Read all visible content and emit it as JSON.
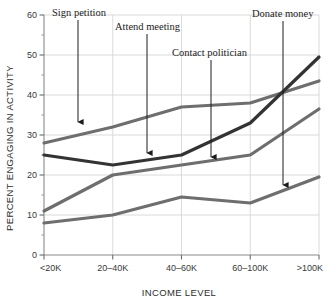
{
  "chart_data": {
    "type": "line",
    "title": "",
    "xlabel": "INCOME LEVEL",
    "ylabel": "PERCENT ENGAGING IN ACTIVITY",
    "categories": [
      "<20K",
      "20–40K",
      "40–60K",
      "60–100K",
      ">100K"
    ],
    "ylim": [
      0,
      60
    ],
    "yticks": [
      0,
      10,
      20,
      30,
      40,
      50,
      60
    ],
    "ytick_labels": [
      "0",
      "10",
      "20",
      "30",
      "40",
      "50",
      "60"
    ],
    "grid": true,
    "grid_axis": "both",
    "legend_position": "none",
    "series": [
      {
        "name": "Sign petition",
        "color": "#6e6e6e",
        "values": [
          28,
          32,
          37,
          38,
          43.5
        ]
      },
      {
        "name": "Contact politician",
        "color": "#333333",
        "values": [
          25,
          22.5,
          25,
          33,
          49.5
        ]
      },
      {
        "name": "Attend meeting",
        "color": "#6e6e6e",
        "values": [
          11,
          20,
          22.5,
          25,
          36.5
        ]
      },
      {
        "name": "Donate money",
        "color": "#6e6e6e",
        "values": [
          8,
          10,
          14.5,
          13,
          19.5
        ]
      }
    ],
    "annotations": [
      {
        "text": "Sign petition",
        "label_x": 52,
        "label_y": 16,
        "arrow_x": 78,
        "arrow_y0": 20,
        "arrow_y1": 122
      },
      {
        "text": "Attend meeting",
        "label_x": 115,
        "label_y": 30,
        "arrow_x": 147,
        "arrow_y0": 34,
        "arrow_y1": 153
      },
      {
        "text": "Contact politician",
        "label_x": 172,
        "label_y": 56,
        "arrow_x": 211,
        "arrow_y0": 60,
        "arrow_y1": 157
      },
      {
        "text": "Donate money",
        "label_x": 252,
        "label_y": 17,
        "arrow_x": 283,
        "arrow_y0": 21,
        "arrow_y1": 185
      }
    ]
  }
}
